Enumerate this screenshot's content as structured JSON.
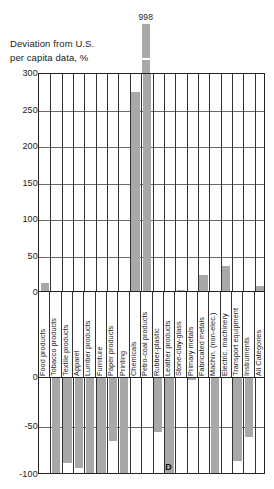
{
  "title": {
    "line1": "Deviation from U.S.",
    "line2": "per capita data, %"
  },
  "annotations": {
    "overflow_value": "998",
    "d_marker": "D"
  },
  "axis": {
    "top_ticks": [
      "300",
      "250",
      "200",
      "150",
      "100",
      "50",
      "0"
    ],
    "bottom_ticks": [
      "0",
      "-50",
      "-100"
    ]
  },
  "chart_data": {
    "type": "bar",
    "title": "Deviation from U.S. per capita data, %",
    "xlabel": "",
    "ylabel": "Deviation from U.S. per capita data, %",
    "ylim": [
      -100,
      300
    ],
    "grid": true,
    "legend": null,
    "broken_axis": true,
    "note": "Petro-coal products bar is truncated; its true value is 998%",
    "categories": [
      "Food products",
      "Tobacco products",
      "Textile products",
      "Apparel",
      "Lumber products",
      "Furniture",
      "Paper products",
      "Printing",
      "Chemicals",
      "Petro-coal products",
      "Rubber-plastic",
      "Leather products",
      "Stone-clay-glass",
      "Primary metals",
      "Fabricated metals",
      "Machin. (non-elec.)",
      "Electric. machinery",
      "Transport equipment",
      "Instruments",
      "All Categories"
    ],
    "values": [
      14,
      -100,
      -88,
      -93,
      -100,
      -100,
      -65,
      -100,
      275,
      998,
      -56,
      -100,
      4,
      -2,
      24,
      -100,
      37,
      -86,
      -61,
      10
    ]
  }
}
